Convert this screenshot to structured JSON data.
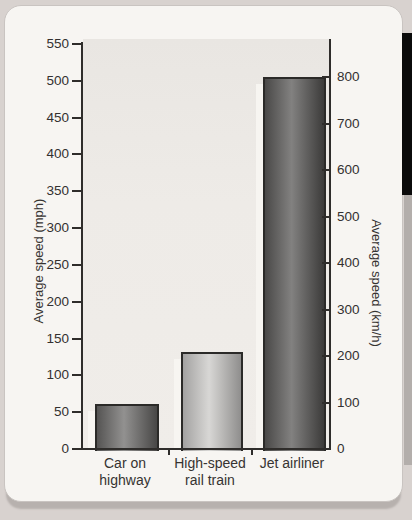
{
  "page": {
    "outer_bg": "#d8d2cf",
    "card_bg": "#f7f5f2",
    "black_tab_color": "#0b0b0b",
    "edge_shadow_color": "#b3aeab"
  },
  "chart_data": {
    "type": "bar",
    "title": "",
    "categories": [
      "Car on highway",
      "High-speed rail train",
      "Jet airliner"
    ],
    "category_label_lines": [
      [
        "Car on",
        "highway"
      ],
      [
        "High-speed",
        "rail train"
      ],
      [
        "Jet airliner"
      ]
    ],
    "series": [
      {
        "name": "Average speed (mph)",
        "values": [
          60,
          130,
          500
        ]
      },
      {
        "name": "Average speed (km/h)",
        "values": [
          97,
          209,
          800
        ]
      }
    ],
    "left_axis": {
      "label": "Average speed (mph)",
      "min": 0,
      "max": 550,
      "tick_step": 50,
      "tick_labels": [
        550,
        500,
        450,
        400,
        350,
        300,
        250,
        200,
        150,
        100,
        50,
        0
      ]
    },
    "right_axis": {
      "label": "Average speed (km/h)",
      "min": 0,
      "max": 800,
      "tick_step": 100,
      "tick_labels": [
        800,
        700,
        600,
        500,
        400,
        300,
        200,
        100,
        0
      ]
    },
    "grid": false,
    "legend": "none",
    "plot_bg": "#ebe8e4",
    "axis_color": "#2f2d2b",
    "bar_colors": [
      {
        "edge1": "#555453",
        "center": "#929190",
        "edge2": "#484746"
      },
      {
        "edge1": "#a3a2a1",
        "center": "#d8d7d5",
        "edge2": "#8f8e8d"
      },
      {
        "edge1": "#4a4948",
        "center": "#828180",
        "edge2": "#3c3b3a"
      }
    ]
  }
}
